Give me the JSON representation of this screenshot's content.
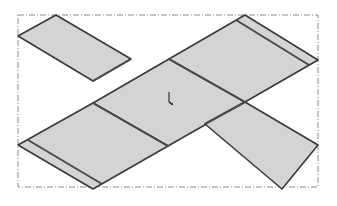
{
  "viewport": {
    "width": 337,
    "height": 206,
    "background": "#ffffff"
  },
  "colors": {
    "face_fill": "#d4d4d4",
    "strip_fill": "#dcdcdc",
    "edge_stroke": "#3a3a3a",
    "bend_line": "#4a4a4a",
    "bbox_stroke": "#8a8a8a",
    "origin_marker": "#333333"
  },
  "bounding_box": {
    "x": 18,
    "y": 15,
    "width": 300,
    "height": 172,
    "style": "dash-dot"
  },
  "panels": [
    {
      "id": "arm-upper-left",
      "points": "18,36 56,15 131,59 93,81"
    },
    {
      "id": "center-diamond",
      "points": "93,103 169,59 245,102 168,146"
    },
    {
      "id": "arm-upper-right",
      "points": "169,59 245,15 318,60 245,102"
    },
    {
      "id": "arm-lower-left",
      "points": "18,145 93,103 168,146 93,189"
    },
    {
      "id": "arm-lower-right",
      "points": "205,124 245,102 318,145 282,189"
    }
  ],
  "bend_lines": [
    {
      "id": "bend-ul-center",
      "x1": 93,
      "y1": 81,
      "x2": 131,
      "y2": 59
    },
    {
      "id": "bend-center-ur",
      "x1": 169,
      "y1": 59,
      "x2": 245,
      "y2": 102
    },
    {
      "id": "bend-center-ll",
      "x1": 93,
      "y1": 103,
      "x2": 168,
      "y2": 146
    },
    {
      "id": "bend-center-lr",
      "x1": 205,
      "y1": 124,
      "x2": 245,
      "y2": 102
    },
    {
      "id": "strip-ur",
      "x1": 236,
      "y1": 20,
      "x2": 309,
      "y2": 65
    },
    {
      "id": "strip-ll",
      "x1": 28,
      "y1": 140,
      "x2": 102,
      "y2": 184
    }
  ],
  "origin": {
    "x": 169,
    "y": 98
  }
}
